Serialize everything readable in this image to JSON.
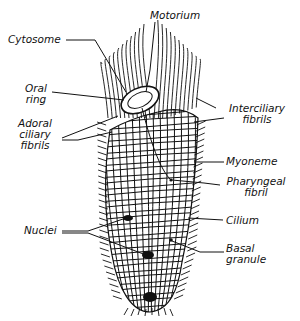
{
  "diagram": {
    "type": "biological-line-drawing",
    "colors": {
      "ink": "#111111",
      "background": "#ffffff"
    },
    "labels": [
      {
        "id": "motorium",
        "lines": [
          "Motorium"
        ]
      },
      {
        "id": "cytosome",
        "lines": [
          "Cytosome"
        ]
      },
      {
        "id": "oral-ring",
        "lines": [
          "Oral",
          "ring"
        ]
      },
      {
        "id": "adoral-ciliary-fibrils",
        "lines": [
          "Adoral",
          "ciliary",
          "fibrils"
        ]
      },
      {
        "id": "interciliary-fibrils",
        "lines": [
          "Interciliary",
          "fibrils"
        ]
      },
      {
        "id": "myoneme",
        "lines": [
          "Myoneme"
        ]
      },
      {
        "id": "pharyngeal-fibril",
        "lines": [
          "Pharyngeal",
          "fibril"
        ]
      },
      {
        "id": "cilium",
        "lines": [
          "Cilium"
        ]
      },
      {
        "id": "nuclei",
        "lines": [
          "Nuclei"
        ]
      },
      {
        "id": "basal-granule",
        "lines": [
          "Basal",
          "granule"
        ]
      }
    ]
  }
}
